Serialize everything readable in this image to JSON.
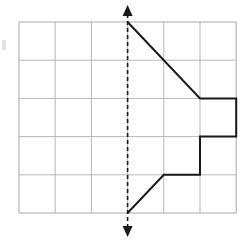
{
  "figure": {
    "background_color": "#ffffff",
    "grid": {
      "label": "square grid",
      "columns": 6,
      "rows": 5,
      "left": 19,
      "top": 22,
      "cell_width": 36.2,
      "cell_height": 38.2,
      "line_color": "#b8b8b8",
      "line_width": 1,
      "border_color": "#a9a9a9",
      "x_lines": [
        19,
        55.2,
        91.4,
        127.6,
        163.8,
        200.0,
        236.2
      ],
      "y_lines": [
        22,
        60.2,
        98.4,
        136.6,
        174.8,
        213.0
      ]
    },
    "mirror_line": {
      "label": "dashed line of symmetry",
      "orientation": "vertical",
      "x": 127.6,
      "y_top": 14,
      "y_bottom": 228,
      "color": "#1a1a1a",
      "line_width": 1.6,
      "dash_pattern": "4 3",
      "arrow_top": {
        "tip_y": 5,
        "base_y": 16,
        "half_width": 5
      },
      "arrow_bottom": {
        "tip_y": 237,
        "base_y": 226,
        "half_width": 5
      }
    },
    "shape": {
      "label": "half of a symmetric figure drawn to the right of the mirror line",
      "stroke_color": "#1a1a1a",
      "stroke_width": 2,
      "fill": "none",
      "vertices_px": [
        [
          127.6,
          22.0
        ],
        [
          200.0,
          98.4
        ],
        [
          236.2,
          98.4
        ],
        [
          236.2,
          136.6
        ],
        [
          200.0,
          136.6
        ],
        [
          200.0,
          174.8
        ],
        [
          163.8,
          174.8
        ],
        [
          127.6,
          213.0
        ]
      ],
      "vertices_grid": [
        [
          0,
          0
        ],
        [
          2,
          2
        ],
        [
          3,
          2
        ],
        [
          3,
          3
        ],
        [
          2,
          3
        ],
        [
          2,
          4
        ],
        [
          1,
          4
        ],
        [
          0,
          5
        ]
      ],
      "segments": [
        "diagonal down-right from top of mirror line to grid point (2,2)",
        "horizontal right to (3,2)",
        "vertical down to (3,3)",
        "horizontal left to (2,3)",
        "vertical down to (2,4)",
        "horizontal left to (1,4)",
        "diagonal down-left to bottom of mirror line at (0,5)"
      ]
    },
    "left_margin_mark": {
      "label": "faint partial mark at left edge",
      "x": 2,
      "y": 40,
      "width": 4,
      "height": 10,
      "color": "#e2e2e2"
    }
  }
}
